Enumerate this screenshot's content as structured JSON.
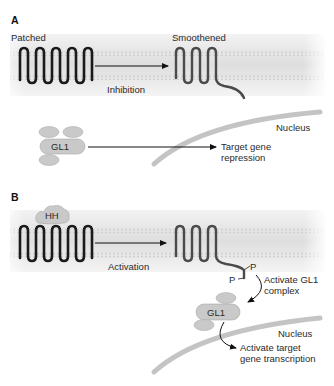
{
  "colors": {
    "patched": "#1a1a1a",
    "smoothened": "#4a4a4a",
    "membrane": "#e4e4e4",
    "membrane_dots": "#c8c8c8",
    "blob_fill": "#c9c9c9",
    "blob_stroke": "#a8a8a8",
    "nucleus": "#c4c4c4",
    "arrow": "#111111"
  },
  "panel_a": {
    "label": "A",
    "patched_label": "Patched",
    "smoothened_label": "Smoothened",
    "arrow_label": "Inhibition",
    "gl1_label": "GL1",
    "nucleus_label": "Nucleus",
    "target_label_line1": "Target gene",
    "target_label_line2": "repression"
  },
  "panel_b": {
    "label": "B",
    "hh_label": "HH",
    "arrow_label": "Activation",
    "p_label_1": "P",
    "p_label_2": "P",
    "activate_gl1_line1": "Activate GL1",
    "activate_gl1_line2": "complex",
    "gl1_label": "GL1",
    "nucleus_label": "Nucleus",
    "target_label_line1": "Activate target",
    "target_label_line2": "gene transcription"
  }
}
